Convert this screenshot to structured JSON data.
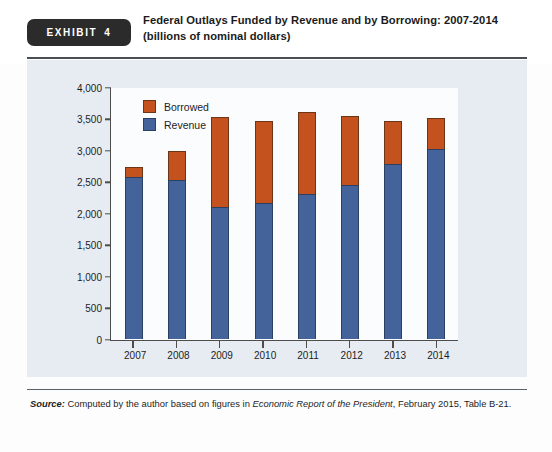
{
  "exhibit": {
    "badge_word": "EXHIBIT",
    "badge_number": "4",
    "title_line1": "Federal Outlays Funded by Revenue and by Borrowing: 2007-2014",
    "title_line2": "(billions of nominal dollars)"
  },
  "source": {
    "lead": "Source:",
    "text_before_italic": " Computed by the author based on figures in ",
    "italic": "Economic Report of the President",
    "text_after_italic": ", February 2015, Table B-21."
  },
  "colors": {
    "revenue": "#44639b",
    "borrowed": "#c4521f",
    "panel_background": "#e7ecf3",
    "plot_background": "#fbfcfd",
    "axis": "#4d4d4d",
    "badge_background": "#2b2b2b"
  },
  "chart_data": {
    "type": "bar",
    "subtype": "stacked-vertical",
    "title": "Federal Outlays Funded by Revenue and by Borrowing: 2007-2014",
    "subtitle": "(billions of nominal dollars)",
    "xlabel": "",
    "ylabel": "",
    "ylim": [
      0,
      4000
    ],
    "yticks": [
      0,
      500,
      1000,
      1500,
      2000,
      2500,
      3000,
      3500,
      4000
    ],
    "ytick_labels": [
      "0",
      "500",
      "1,000",
      "1,500",
      "2,000",
      "2,500",
      "3,000",
      "3,500",
      "4,000"
    ],
    "grid": false,
    "legend_position": "top-left-inside",
    "categories": [
      "2007",
      "2008",
      "2009",
      "2010",
      "2011",
      "2012",
      "2013",
      "2014"
    ],
    "series": [
      {
        "name": "Revenue",
        "color": "#44639b",
        "values": [
          2570,
          2520,
          2100,
          2160,
          2300,
          2450,
          2775,
          3020
        ]
      },
      {
        "name": "Borrowed",
        "color": "#c4521f",
        "values": [
          160,
          460,
          1420,
          1295,
          1300,
          1085,
          680,
          480
        ]
      }
    ],
    "totals": [
      2730,
      2980,
      3520,
      3455,
      3600,
      3535,
      3455,
      3500
    ]
  }
}
